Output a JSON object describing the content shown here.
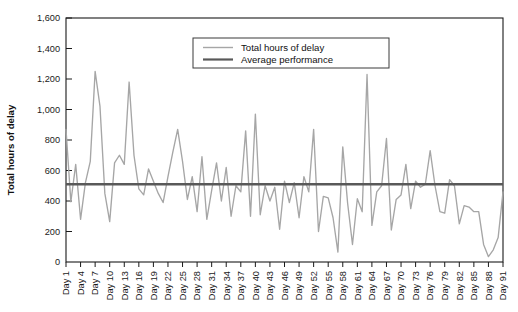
{
  "chart_data": {
    "type": "line",
    "title": "",
    "xlabel": "",
    "ylabel": "Total hours of delay",
    "ylim": [
      0,
      1600
    ],
    "ytick_step": 200,
    "yticks": [
      "0",
      "200",
      "400",
      "600",
      "800",
      "1,000",
      "1,200",
      "1,400",
      "1,600"
    ],
    "grid": false,
    "legend_position": "top-center-right",
    "x_tick_step_days": 3,
    "x_first_label": "Day 1",
    "x_last_label": "Day 91",
    "xtick_labels": [
      "Day 1",
      "Day 4",
      "Day 7",
      "Day 10",
      "Day 13",
      "Day 16",
      "Day 19",
      "Day 22",
      "Day 25",
      "Day 28",
      "Day 31",
      "Day 34",
      "Day 37",
      "Day 40",
      "Day 43",
      "Day 46",
      "Day 49",
      "Day 52",
      "Day 55",
      "Day 58",
      "Day 61",
      "Day 64",
      "Day 67",
      "Day 70",
      "Day 73",
      "Day 76",
      "Day 79",
      "Day 82",
      "Day 85",
      "Day 88",
      "Day 91"
    ],
    "series": [
      {
        "name": "Total hours of delay",
        "color": "#a6a6a6",
        "type": "line",
        "x": [
          1,
          2,
          3,
          4,
          5,
          6,
          7,
          8,
          9,
          10,
          11,
          12,
          13,
          14,
          15,
          16,
          17,
          18,
          19,
          20,
          21,
          22,
          23,
          24,
          25,
          26,
          27,
          28,
          29,
          30,
          31,
          32,
          33,
          34,
          35,
          36,
          37,
          38,
          39,
          40,
          41,
          42,
          43,
          44,
          45,
          46,
          47,
          48,
          49,
          50,
          51,
          52,
          53,
          54,
          55,
          56,
          57,
          58,
          59,
          60,
          61,
          62,
          63,
          64,
          65,
          66,
          67,
          68,
          69,
          70,
          71,
          72,
          73,
          74,
          75,
          76,
          77,
          78,
          79,
          80,
          81,
          82,
          83,
          84,
          85,
          86,
          87,
          88,
          89,
          90,
          91
        ],
        "values": [
          870,
          395,
          640,
          280,
          520,
          660,
          1250,
          1020,
          450,
          265,
          650,
          700,
          640,
          1180,
          700,
          480,
          440,
          610,
          530,
          450,
          390,
          560,
          720,
          870,
          660,
          410,
          560,
          330,
          690,
          280,
          470,
          650,
          400,
          620,
          300,
          500,
          460,
          860,
          300,
          970,
          310,
          500,
          400,
          490,
          215,
          530,
          390,
          520,
          290,
          560,
          460,
          870,
          200,
          430,
          420,
          290,
          65,
          755,
          385,
          115,
          415,
          330,
          1230,
          240,
          460,
          500,
          810,
          210,
          410,
          440,
          640,
          350,
          530,
          490,
          510,
          730,
          500,
          330,
          320,
          540,
          500,
          250,
          370,
          360,
          330,
          330,
          115,
          35,
          80,
          160,
          460
        ]
      },
      {
        "name": "Average performance",
        "color": "#595959",
        "type": "constant-line",
        "value": 510
      }
    ],
    "legend": [
      {
        "label": "Total hours of delay",
        "color": "#a6a6a6",
        "width": 1.4
      },
      {
        "label": "Average performance",
        "color": "#595959",
        "width": 2.2
      }
    ]
  }
}
